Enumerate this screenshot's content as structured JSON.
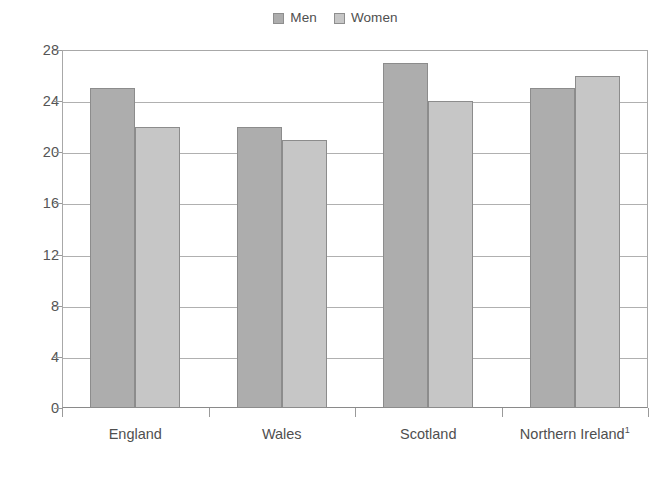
{
  "chart_data": {
    "type": "bar",
    "title": "",
    "subtitle": "",
    "xlabel": "",
    "ylabel": "",
    "categories": [
      "England",
      "Wales",
      "Scotland",
      "Northern Ireland"
    ],
    "category_footnotes": [
      "",
      "",
      "",
      "1"
    ],
    "series": [
      {
        "name": "Men",
        "color": "#adadad",
        "values": [
          25,
          22,
          27,
          25
        ]
      },
      {
        "name": "Women",
        "color": "#c6c6c6",
        "values": [
          22,
          21,
          24,
          26
        ]
      }
    ],
    "ylim": [
      0,
      28
    ],
    "yticks": [
      0,
      4,
      8,
      12,
      16,
      20,
      24,
      28
    ],
    "ytick_labels": [
      "0",
      "4",
      "8",
      "12",
      "16",
      "20",
      "24",
      "28"
    ],
    "grid": true,
    "grid_axis": "y",
    "legend_position": "top-center"
  },
  "legend": {
    "entries": [
      {
        "label": "Men",
        "swatch_color": "#adadad"
      },
      {
        "label": "Women",
        "swatch_color": "#c6c6c6"
      }
    ]
  },
  "axes": {
    "y": {
      "labels": [
        "28",
        "24",
        "20",
        "16",
        "12",
        "8",
        "4",
        "0"
      ]
    },
    "x": {
      "labels": [
        "England",
        "Wales",
        "Scotland",
        "Northern Ireland"
      ],
      "footnote_marks": [
        "",
        "",
        "",
        "1"
      ]
    }
  },
  "caption": {
    "clipped_text": ""
  },
  "colors": {
    "men_bar": "#adadad",
    "women_bar": "#c6c6c6",
    "bar_border": "#8c8c8c",
    "gridline": "#b0b0b0",
    "axis": "#8a8a8a",
    "text": "#4f4f4f",
    "background": "#ffffff"
  }
}
